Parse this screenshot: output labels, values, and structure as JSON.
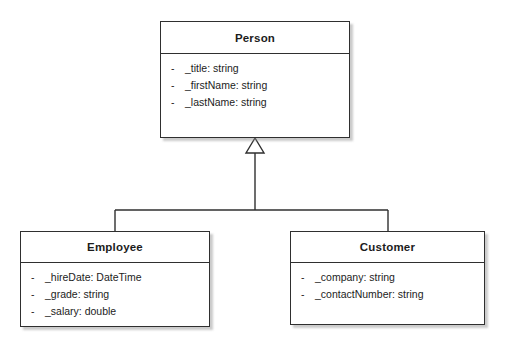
{
  "diagram": {
    "type": "uml-class-diagram",
    "notation": "UML",
    "background_color": "#ffffff",
    "line_color": "#2f2f2f",
    "text_color": "#1c1c1c"
  },
  "classes": [
    {
      "id": "person",
      "name": "Person",
      "role": "superclass",
      "attributes": [
        {
          "visibility": "-",
          "text": "_title: string"
        },
        {
          "visibility": "-",
          "text": "_firstName: string"
        },
        {
          "visibility": "-",
          "text": "_lastName: string"
        }
      ]
    },
    {
      "id": "employee",
      "name": "Employee",
      "role": "subclass",
      "attributes": [
        {
          "visibility": "-",
          "text": "_hireDate: DateTime"
        },
        {
          "visibility": "-",
          "text": "_grade: string"
        },
        {
          "visibility": "-",
          "text": "_salary: double"
        }
      ]
    },
    {
      "id": "customer",
      "name": "Customer",
      "role": "subclass",
      "attributes": [
        {
          "visibility": "-",
          "text": "_company: string"
        },
        {
          "visibility": "-",
          "text": "_contactNumber: string"
        }
      ]
    }
  ],
  "relationships": [
    {
      "kind": "generalization",
      "label": "",
      "from": "Employee",
      "to": "Person",
      "arrow": "hollow-triangle"
    },
    {
      "kind": "generalization",
      "label": "",
      "from": "Customer",
      "to": "Person",
      "arrow": "hollow-triangle"
    }
  ]
}
